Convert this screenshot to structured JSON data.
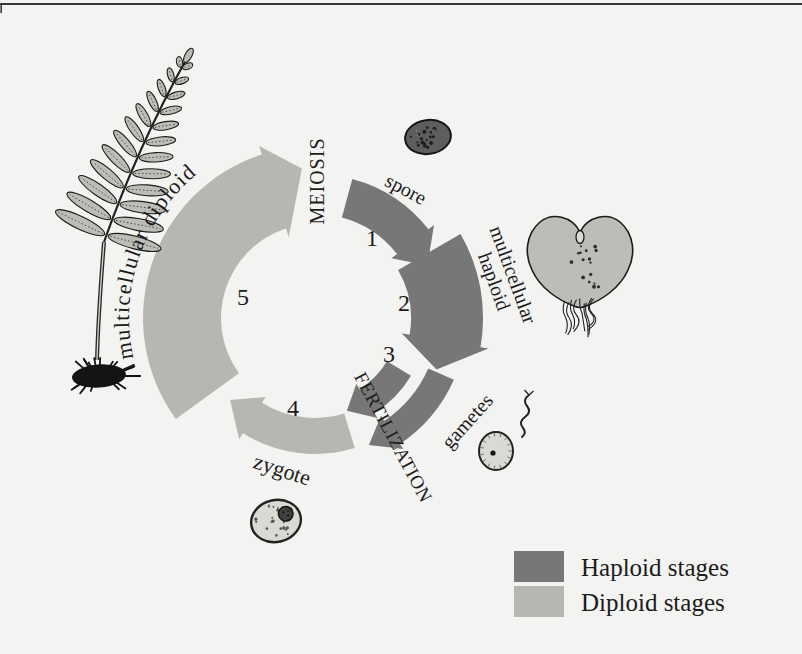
{
  "colors": {
    "background": "#f3f3f1",
    "haploid": "#777777",
    "diploid": "#b6b6b3",
    "ink": "#1c1c1c",
    "rule": "#3a3a3a",
    "leaf": "#bdbdb7",
    "cell": "#dadad4",
    "spore_fill": "#5e5e5e"
  },
  "cycle": {
    "flow": "clockwise",
    "processes": {
      "meiosis": "MEIOSIS",
      "fertilization": "FERTILIZATION"
    },
    "stages": [
      {
        "number": "1",
        "label": "spore",
        "ploidy": "haploid"
      },
      {
        "number": "2",
        "label": "multicellular haploid",
        "label_lines": [
          "multicellular",
          "haploid"
        ],
        "ploidy": "haploid"
      },
      {
        "number": "3",
        "label": "gametes",
        "ploidy": "haploid"
      },
      {
        "number": "4",
        "label": "zygote",
        "ploidy": "diploid"
      },
      {
        "number": "5",
        "label": "multicellular diploid",
        "ploidy": "diploid"
      }
    ]
  },
  "legend": {
    "items": [
      {
        "label": "Haploid stages",
        "color": "#777777"
      },
      {
        "label": "Diploid stages",
        "color": "#b6b6b3"
      }
    ]
  }
}
